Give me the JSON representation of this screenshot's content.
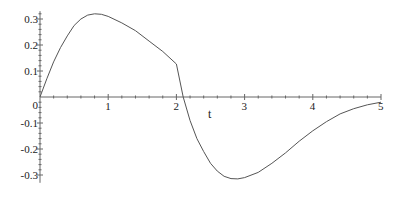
{
  "chart_data": {
    "type": "line",
    "title": "",
    "xlabel": "t",
    "ylabel": "",
    "xlim": [
      0,
      5
    ],
    "ylim": [
      -0.3,
      0.3
    ],
    "grid": false,
    "legend": null,
    "x_ticks": [
      "1",
      "2",
      "3",
      "4",
      "5"
    ],
    "y_ticks": [
      "0.3",
      "0.2",
      "0.1",
      "0",
      "-0.1",
      "-0.2",
      "-0.3"
    ],
    "series": [
      {
        "name": "curve",
        "color": "#555555",
        "x": [
          0,
          0.1,
          0.2,
          0.3,
          0.4,
          0.5,
          0.6,
          0.7,
          0.8,
          0.9,
          1.0,
          1.2,
          1.4,
          1.6,
          1.8,
          2.0,
          2.1,
          2.2,
          2.3,
          2.4,
          2.5,
          2.6,
          2.7,
          2.8,
          2.9,
          3.0,
          3.2,
          3.4,
          3.6,
          3.8,
          4.0,
          4.2,
          4.4,
          4.6,
          4.8,
          5.0
        ],
        "values": [
          0,
          0.07,
          0.135,
          0.19,
          0.235,
          0.275,
          0.3,
          0.315,
          0.32,
          0.318,
          0.31,
          0.285,
          0.255,
          0.215,
          0.175,
          0.127,
          0.0,
          -0.09,
          -0.16,
          -0.21,
          -0.255,
          -0.285,
          -0.305,
          -0.314,
          -0.315,
          -0.31,
          -0.29,
          -0.255,
          -0.215,
          -0.17,
          -0.13,
          -0.095,
          -0.065,
          -0.045,
          -0.03,
          -0.02
        ]
      }
    ]
  },
  "axes": {
    "x_label": "t",
    "x_ticks": [
      {
        "label": "1",
        "value": 1
      },
      {
        "label": "2",
        "value": 2
      },
      {
        "label": "3",
        "value": 3
      },
      {
        "label": "4",
        "value": 4
      },
      {
        "label": "5",
        "value": 5
      }
    ],
    "y_ticks": [
      {
        "label": "0.3",
        "value": 0.3
      },
      {
        "label": "0.2",
        "value": 0.2
      },
      {
        "label": "0.1",
        "value": 0.1
      },
      {
        "label": "0",
        "value": 0
      },
      {
        "label": "-0.1",
        "value": -0.1
      },
      {
        "label": "-0.2",
        "value": -0.2
      },
      {
        "label": "-0.3",
        "value": -0.3
      }
    ]
  }
}
